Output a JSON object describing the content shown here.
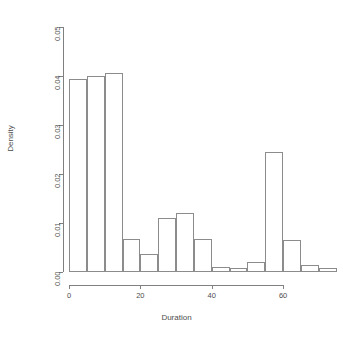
{
  "chart_data": {
    "type": "bar",
    "title": "",
    "subtitle": "",
    "xlabel": "Duration",
    "ylabel": "Density",
    "grid": false,
    "legend": null,
    "xlim": [
      0,
      74
    ],
    "ylim": [
      0.0,
      0.05
    ],
    "bin_width": 5,
    "x_ticks": [
      0,
      20,
      40,
      60
    ],
    "x_tick_labels": [
      "0",
      "20",
      "40",
      "60"
    ],
    "y_ticks": [
      0.0,
      0.01,
      0.02,
      0.03,
      0.04,
      0.05
    ],
    "y_tick_labels": [
      "0.00",
      "0.01",
      "0.02",
      "0.03",
      "0.04",
      "0.05"
    ],
    "categories": [
      "0-5",
      "5-10",
      "10-15",
      "15-20",
      "20-25",
      "25-30",
      "30-35",
      "35-40",
      "40-45",
      "45-50",
      "50-55",
      "55-60",
      "60-65",
      "65-70",
      "70-75"
    ],
    "bin_starts": [
      0,
      5,
      10,
      15,
      20,
      25,
      30,
      35,
      40,
      45,
      50,
      55,
      60,
      65,
      70
    ],
    "bin_ends": [
      5,
      10,
      15,
      20,
      25,
      30,
      35,
      40,
      45,
      50,
      55,
      60,
      65,
      70,
      75
    ],
    "values": [
      0.0393,
      0.0401,
      0.0406,
      0.0068,
      0.0037,
      0.011,
      0.012,
      0.0067,
      0.0011,
      0.0008,
      0.0021,
      0.0245,
      0.0065,
      0.0015,
      0.0008
    ],
    "bar_fill": "#ffffff",
    "bar_border": "#8c8c8c",
    "axis_color": "#808080",
    "text_color": "#4d4d4d",
    "background": "#ffffff"
  }
}
